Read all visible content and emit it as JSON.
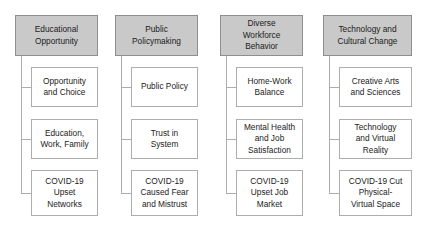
{
  "diagram": {
    "type": "hierarchy-tree",
    "orientation": "vertical-columns",
    "column_count": 4,
    "children_per_column": 3,
    "colors": {
      "header_fill": "#c9c9c9",
      "header_border": "#8e8e8e",
      "child_fill": "#ffffff",
      "child_border": "#adadad",
      "connector": "#adadad",
      "text": "#1b1b1b",
      "background": "#ffffff"
    },
    "columns": [
      {
        "id": "educational-opportunity",
        "header": "Educational Opportunity",
        "header_lines": [
          "Educational",
          "Opportunity"
        ],
        "children": [
          {
            "id": "opportunity-and-choice",
            "label": "Opportunity and Choice",
            "lines": [
              "Opportunity",
              "and Choice"
            ]
          },
          {
            "id": "education-work-family",
            "label": "Education, Work, Family",
            "lines": [
              "Education,",
              "Work, Family"
            ]
          },
          {
            "id": "covid-19-upset-networks",
            "label": "COVID-19 Upset Networks",
            "lines": [
              "COVID-19",
              "Upset",
              "Networks"
            ]
          }
        ]
      },
      {
        "id": "public-policymaking",
        "header": "Public Policymaking",
        "header_lines": [
          "Public",
          "Policymaking"
        ],
        "children": [
          {
            "id": "public-policy",
            "label": "Public Policy",
            "lines": [
              "Public Policy"
            ]
          },
          {
            "id": "trust-in-system",
            "label": "Trust in System",
            "lines": [
              "Trust in",
              "System"
            ]
          },
          {
            "id": "covid-19-caused-fear-and-mistrust",
            "label": "COVID-19 Caused Fear and Mistrust",
            "lines": [
              "COVID-19",
              "Caused Fear",
              "and Mistrust"
            ]
          }
        ]
      },
      {
        "id": "diverse-workforce-behavior",
        "header": "Diverse Workforce Behavior",
        "header_lines": [
          "Diverse",
          "Workforce",
          "Behavior"
        ],
        "children": [
          {
            "id": "home-work-balance",
            "label": "Home-Work Balance",
            "lines": [
              "Home-Work",
              "Balance"
            ]
          },
          {
            "id": "mental-health-and-job-satisfaction",
            "label": "Mental Health and Job Satisfaction",
            "lines": [
              "Mental Health",
              "and Job",
              "Satisfaction"
            ]
          },
          {
            "id": "covid-19-upset-job-market",
            "label": "COVID-19 Upset Job Market",
            "lines": [
              "COVID-19",
              "Upset Job",
              "Market"
            ]
          }
        ]
      },
      {
        "id": "technology-and-cultural-change",
        "header": "Technology and Cultural Change",
        "header_lines": [
          "Technology and",
          "Cultural Change"
        ],
        "children": [
          {
            "id": "creative-arts-and-sciences",
            "label": "Creative Arts and Sciences",
            "lines": [
              "Creative Arts",
              "and Sciences"
            ]
          },
          {
            "id": "technology-and-virtual-reality",
            "label": "Technology and Virtual Reality",
            "lines": [
              "Technology",
              "and Virtual",
              "Reality"
            ]
          },
          {
            "id": "covid-19-cut-physical-virtual-space",
            "label": "COVID-19 Cut Physical-Virtual Space",
            "lines": [
              "COVID-19 Cut",
              "Physical-",
              "Virtual Space"
            ]
          }
        ]
      }
    ]
  }
}
